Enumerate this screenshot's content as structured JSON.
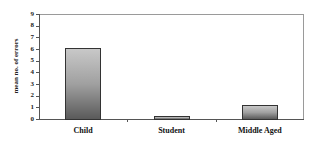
{
  "chart_data": {
    "type": "bar",
    "title": "",
    "xlabel": "",
    "ylabel": "mean no. of errors",
    "categories": [
      "Child",
      "Student",
      "Middle Aged"
    ],
    "values": [
      6.1,
      0.3,
      1.2
    ],
    "ylim": [
      0,
      9
    ],
    "yticks": [
      "0",
      "1",
      "2",
      "3",
      "4",
      "5",
      "6",
      "7",
      "8",
      "9"
    ],
    "grid": false,
    "legend": null,
    "bar_fill": "gray vertical gradient",
    "colors": {
      "bar_top": "#c8c8c8",
      "bar_bottom": "#5a5a5a",
      "border": "#333333"
    }
  }
}
